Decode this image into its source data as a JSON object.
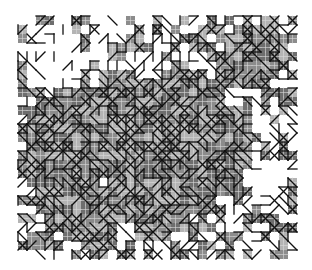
{
  "figure": {
    "type": "triangulated-mesh-texture",
    "width": 312,
    "height": 270,
    "background": "#ffffff",
    "bounds": {
      "x0": 18,
      "y0": 16,
      "x1": 296,
      "y1": 252
    },
    "cell_size": 9,
    "colors": {
      "line": "#111111",
      "fill_dark": "#6e6e6e",
      "fill_mid": "#8c8c8c",
      "fill_light": "#b4b4b4",
      "inner_grid": "#d8d8d8"
    },
    "dense_regions": [
      {
        "cx": 120,
        "cy": 160,
        "rx": 110,
        "ry": 95
      },
      {
        "cx": 255,
        "cy": 55,
        "rx": 40,
        "ry": 35
      },
      {
        "cx": 190,
        "cy": 140,
        "rx": 70,
        "ry": 80
      }
    ],
    "holes": [
      {
        "cx": 95,
        "cy": 80,
        "r": 12
      },
      {
        "cx": 232,
        "cy": 100,
        "r": 14
      },
      {
        "cx": 106,
        "cy": 185,
        "r": 10
      },
      {
        "cx": 125,
        "cy": 232,
        "r": 14
      },
      {
        "cx": 268,
        "cy": 180,
        "r": 22
      },
      {
        "cx": 60,
        "cy": 60,
        "r": 30
      }
    ],
    "seed": 7
  }
}
